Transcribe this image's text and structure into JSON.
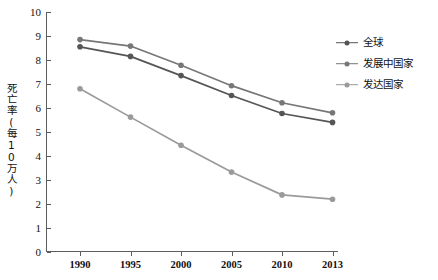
{
  "chart_data": {
    "type": "line",
    "title": "",
    "xlabel": "",
    "ylabel": "死亡率(每10万人)",
    "categories": [
      "1990",
      "1995",
      "2000",
      "2005",
      "2010",
      "2013"
    ],
    "ylim": [
      0,
      10
    ],
    "yticks": [
      "0",
      "1",
      "2",
      "3",
      "4",
      "5",
      "6",
      "7",
      "8",
      "9",
      "10"
    ],
    "grid": false,
    "legend_position": "right",
    "series": [
      {
        "name": "全球",
        "color": "#555555",
        "values": [
          8.55,
          8.15,
          7.35,
          6.52,
          5.77,
          5.4
        ]
      },
      {
        "name": "发展中国家",
        "color": "#777777",
        "values": [
          8.85,
          8.58,
          7.78,
          6.93,
          6.22,
          5.8
        ]
      },
      {
        "name": "发达国家",
        "color": "#9a9a9a",
        "values": [
          6.8,
          5.62,
          4.45,
          3.33,
          2.38,
          2.2
        ]
      }
    ]
  },
  "axis": {
    "color": "#5d5d5d"
  }
}
